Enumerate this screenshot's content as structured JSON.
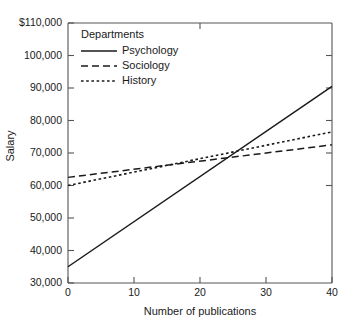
{
  "chart_data": {
    "type": "line",
    "title": "",
    "xlabel": "Number of publications",
    "ylabel": "Salary",
    "xlim": [
      0,
      40
    ],
    "ylim": [
      30000,
      110000
    ],
    "grid": false,
    "legend_position": "top-left-inside",
    "legend_title": "Departments",
    "xticks": [
      0,
      10,
      20,
      30,
      40
    ],
    "xtick_labels": [
      "0",
      "10",
      "20",
      "30",
      "40"
    ],
    "yticks": [
      30000,
      40000,
      50000,
      60000,
      70000,
      80000,
      90000,
      100000,
      110000
    ],
    "ytick_labels": [
      "30,000",
      "40,000",
      "50,000",
      "60,000",
      "70,000",
      "80,000",
      "90,000",
      "100,000",
      "$110,000"
    ],
    "x": [
      0,
      40
    ],
    "series": [
      {
        "name": "Psychology",
        "style": "solid",
        "color": "#1a1a1a",
        "values": [
          35000,
          90500
        ]
      },
      {
        "name": "Sociology",
        "style": "dashed",
        "color": "#1a1a1a",
        "values": [
          62500,
          72500
        ]
      },
      {
        "name": "History",
        "style": "dotted",
        "color": "#1a1a1a",
        "values": [
          60000,
          76500
        ]
      }
    ]
  },
  "axes": {
    "y_title": "Salary",
    "x_title": "Number of publications",
    "y_labels": {
      "t110": "$110,000",
      "t100": "100,000",
      "t90": "90,000",
      "t80": "80,000",
      "t70": "70,000",
      "t60": "60,000",
      "t50": "50,000",
      "t40": "40,000",
      "t30": "30,000"
    },
    "x_labels": {
      "t0": "0",
      "t10": "10",
      "t20": "20",
      "t30": "30",
      "t40": "40"
    }
  },
  "legend": {
    "title": "Departments",
    "items": [
      {
        "label": "Psychology",
        "style": "solid"
      },
      {
        "label": "Sociology",
        "style": "dashed"
      },
      {
        "label": "History",
        "style": "dotted"
      }
    ]
  },
  "colors": {
    "ink": "#1a1a1a",
    "axis": "#555555",
    "background": "#ffffff"
  }
}
